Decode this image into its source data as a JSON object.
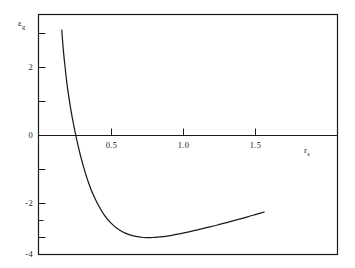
{
  "chart_data": {
    "type": "line",
    "title": "",
    "subtitle": "",
    "xlabel": "r_s",
    "xlabel_base": "r",
    "xlabel_sub": "s",
    "ylabel": "ε_g",
    "ylabel_base": "ε",
    "ylabel_sub": "g",
    "xlim": [
      0.0,
      1.78
    ],
    "ylim": [
      -4.0,
      3.1
    ],
    "xticks": [
      0.5,
      1.0,
      1.5
    ],
    "xticklabels": [
      "0.5",
      "1.0",
      "1.5"
    ],
    "yticks": [
      -4,
      -3,
      -2,
      -1,
      0,
      1,
      2,
      3
    ],
    "yticklabels_shown": {
      "2": "2",
      "0": "0",
      "-2": "-2",
      "-4": "-4"
    },
    "grid": false,
    "legend": null,
    "line_color": "#1a1a1a",
    "frame_color": "#1a1a1a",
    "series": [
      {
        "name": "curve",
        "x": [
          0.155,
          0.16,
          0.168,
          0.178,
          0.19,
          0.205,
          0.22,
          0.24,
          0.26,
          0.285,
          0.31,
          0.34,
          0.375,
          0.41,
          0.45,
          0.495,
          0.545,
          0.6,
          0.66,
          0.72,
          0.78,
          0.84,
          0.9,
          0.96,
          1.02,
          1.09,
          1.16,
          1.23,
          1.3,
          1.37,
          1.44,
          1.51,
          1.56
        ],
        "y": [
          3.1,
          2.8,
          2.4,
          2.0,
          1.55,
          1.1,
          0.7,
          0.25,
          -0.15,
          -0.6,
          -0.98,
          -1.38,
          -1.76,
          -2.06,
          -2.34,
          -2.57,
          -2.75,
          -2.88,
          -2.96,
          -3.0,
          -3.0,
          -2.98,
          -2.95,
          -2.9,
          -2.85,
          -2.78,
          -2.71,
          -2.64,
          -2.56,
          -2.48,
          -2.4,
          -2.31,
          -2.25
        ]
      }
    ],
    "annotations": {
      "zero_crossing_x": 0.205,
      "minimum_x": 0.76,
      "minimum_y": -3.0
    }
  },
  "axes": {
    "x_axis_label": "r",
    "x_axis_sub": "s",
    "y_axis_label": "ε",
    "y_axis_sub": "g",
    "x_tick_labels": [
      "0.5",
      "1.0",
      "1.5"
    ],
    "y_tick_labels": [
      "2",
      "0",
      "-2",
      "-4"
    ]
  }
}
